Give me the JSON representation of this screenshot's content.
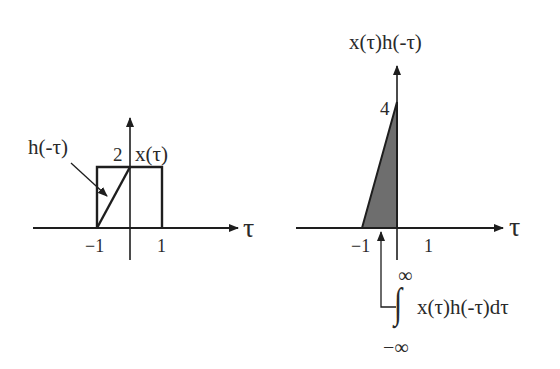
{
  "left_plot": {
    "h_label": "h(-τ)",
    "x_label": "x(τ)",
    "peak_value": "2",
    "tick_neg": "−1",
    "tick_pos": "1",
    "axis_label": "τ"
  },
  "right_plot": {
    "title": "x(τ)h(-τ)",
    "peak_value": "4",
    "tick_neg": "−1",
    "tick_pos": "1",
    "axis_label": "τ",
    "integral_upper": "∞",
    "integral_lower": "−∞",
    "integral_sign": "∫",
    "integral_expr": "x(τ)h(-τ)dτ"
  },
  "colors": {
    "line": "#1e1e1e",
    "fill": "#6e6e6e"
  }
}
